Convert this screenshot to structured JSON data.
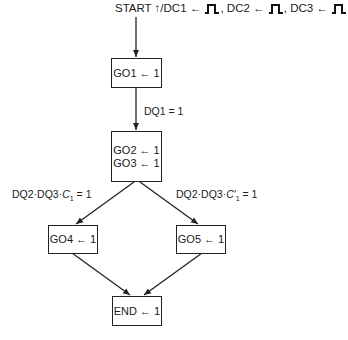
{
  "diagram": {
    "type": "flowchart",
    "start": {
      "prefix": "START ↑/DC1 ← ",
      "dc2": ", DC2 ← ",
      "dc3": ", DC3 ← ",
      "pulse_icon": "single-pulse"
    },
    "nodes": {
      "go1": [
        "GO1 ← 1"
      ],
      "go23": [
        "GO2 ← 1",
        "GO3 ← 1"
      ],
      "go4": [
        "GO4 ← 1"
      ],
      "go5": [
        "GO5 ← 1"
      ],
      "end": [
        "END ← 1"
      ]
    },
    "edges": {
      "go1_to_go23": "DQ1 = 1",
      "go23_to_go4": {
        "prefix": "DQ2·DQ3·",
        "var": "C",
        "sub": "1",
        "suffix": " = 1"
      },
      "go23_to_go5": {
        "prefix": "DQ2·DQ3·",
        "var": "C′",
        "sub": "1",
        "suffix": " = 1"
      }
    }
  }
}
